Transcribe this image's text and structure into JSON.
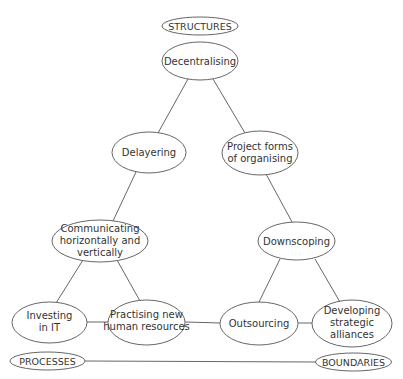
{
  "diagram": {
    "type": "triangle-concept-map",
    "corners": {
      "top": "STRUCTURES",
      "bottom_left": "PROCESSES",
      "bottom_right": "BOUNDARIES"
    },
    "nodes": {
      "decentralising": {
        "lines": [
          "Decentralising"
        ]
      },
      "delayering": {
        "lines": [
          "Delayering"
        ]
      },
      "project_forms": {
        "lines": [
          "Project forms",
          "of organising"
        ]
      },
      "communicating": {
        "lines": [
          "Communicating",
          "horizontally and",
          "vertically"
        ]
      },
      "downscoping": {
        "lines": [
          "Downscoping"
        ]
      },
      "investing_it": {
        "lines": [
          "Investing",
          "in IT"
        ]
      },
      "practising_hr": {
        "lines": [
          "Practising new",
          "human resources"
        ]
      },
      "outsourcing": {
        "lines": [
          "Outsourcing"
        ]
      },
      "developing_alliances": {
        "lines": [
          "Developing",
          "strategic",
          "alliances"
        ]
      }
    },
    "edges": [
      [
        "decentralising",
        "delayering"
      ],
      [
        "decentralising",
        "project_forms"
      ],
      [
        "delayering",
        "communicating"
      ],
      [
        "project_forms",
        "downscoping"
      ],
      [
        "communicating",
        "investing_it"
      ],
      [
        "communicating",
        "practising_hr"
      ],
      [
        "downscoping",
        "outsourcing"
      ],
      [
        "downscoping",
        "developing_alliances"
      ],
      [
        "investing_it",
        "practising_hr"
      ],
      [
        "practising_hr",
        "outsourcing"
      ],
      [
        "outsourcing",
        "developing_alliances"
      ],
      [
        "PROCESSES",
        "BOUNDARIES"
      ]
    ]
  }
}
